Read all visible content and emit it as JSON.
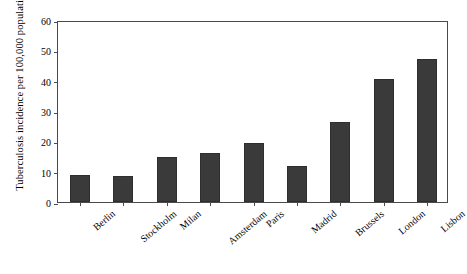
{
  "chart_data": {
    "type": "bar",
    "title": "",
    "xlabel": "",
    "ylabel": "Tuberculosis incidence per 100,000 population",
    "categories": [
      "Berlin",
      "Stockholm",
      "Milan",
      "Amsterdam",
      "Paris",
      "Madrid",
      "Brussels",
      "London",
      "Lisbon"
    ],
    "values": [
      9,
      8.5,
      15,
      16,
      19.5,
      12,
      26.5,
      40.5,
      47
    ],
    "ylim": [
      0,
      60
    ],
    "yticks": [
      0,
      10,
      20,
      30,
      40,
      50,
      60
    ],
    "ytick_labels": [
      "0",
      "10",
      "20",
      "30",
      "40",
      "50",
      "60"
    ],
    "grid": false,
    "legend": "none",
    "bar_color": "#3a3a3a",
    "axis_color": "#4a4a4a",
    "background_color": "#ffffff"
  }
}
